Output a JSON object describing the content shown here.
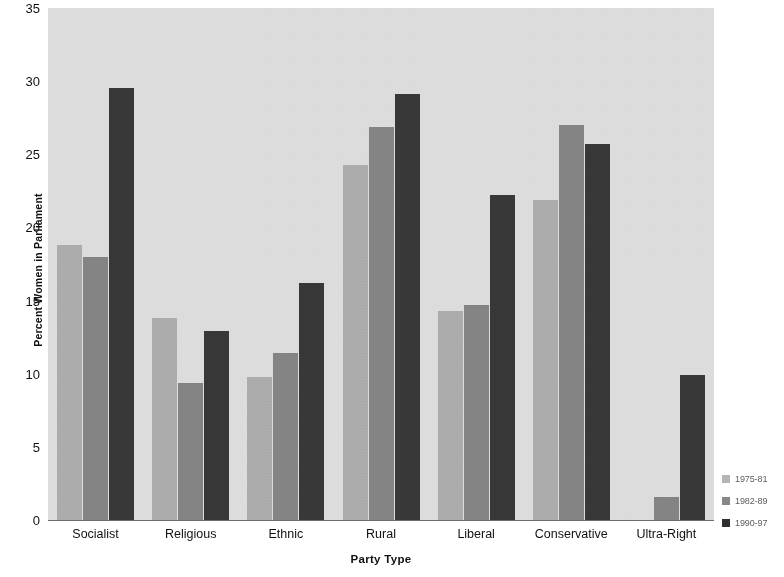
{
  "chart_data": {
    "type": "bar",
    "title": "",
    "xlabel": "Party Type",
    "ylabel": "Percent Women in Parliament",
    "ylim": [
      0,
      35
    ],
    "yticks": [
      0,
      5,
      10,
      15,
      20,
      25,
      30,
      35
    ],
    "grid": false,
    "legend_position": "right-bottom",
    "categories": [
      "Socialist",
      "Religious",
      "Ethnic",
      "Rural",
      "Liberal",
      "Conservative",
      "Ultra-Right"
    ],
    "series": [
      {
        "name": "1975-81",
        "color": "#b5b5b5",
        "values": [
          18.8,
          13.8,
          9.8,
          24.3,
          14.3,
          21.9,
          0.0
        ]
      },
      {
        "name": "1982-89",
        "color": "#878787",
        "values": [
          18.0,
          9.4,
          11.4,
          26.9,
          14.7,
          27.0,
          1.6
        ]
      },
      {
        "name": "1990-97",
        "color": "#2f2f2f",
        "values": [
          29.5,
          12.9,
          16.2,
          29.1,
          22.2,
          25.7,
          9.9
        ]
      }
    ]
  },
  "plot": {
    "background_color": "#e2e2e2",
    "axis_color": "#6d6d6d"
  }
}
